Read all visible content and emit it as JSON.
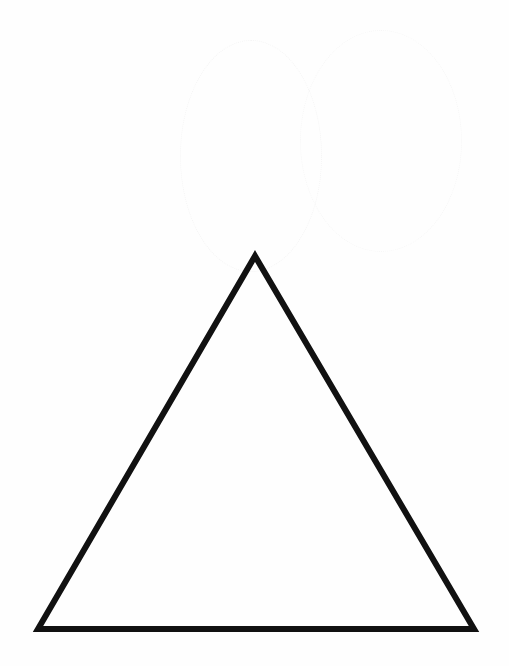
{
  "diagram": {
    "background_color": "#ffffff",
    "shapes": [
      {
        "type": "triangle",
        "fill": "none",
        "stroke": "#111111",
        "stroke_width": 6,
        "points": [
          [
            255,
            256
          ],
          [
            38,
            629
          ],
          [
            474,
            629
          ]
        ]
      }
    ]
  }
}
